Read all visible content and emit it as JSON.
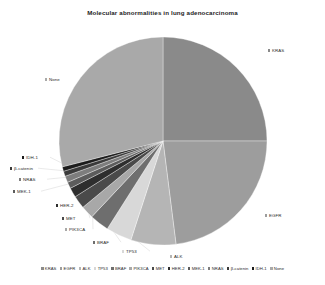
{
  "chart_data": {
    "type": "pie",
    "title": "Molecular abnormalities in lung adenocarcinoma",
    "xlabel": "",
    "ylabel": "",
    "legend_position": "bottom",
    "grid": false,
    "start_angle_deg": 0,
    "direction": "clockwise",
    "categories": [
      "KRAS",
      "EGFR",
      "ALK",
      "TP53",
      "BRAF",
      "PIK3CA",
      "MET",
      "HER-2",
      "MEK-1",
      "NRAS",
      "β-catenin",
      "IDH-1",
      "None"
    ],
    "values": [
      25,
      23,
      7,
      4,
      3,
      2,
      2,
      1.5,
      1,
      1,
      0.8,
      0.7,
      29
    ],
    "colors": [
      "#8a8a8a",
      "#9d9d9d",
      "#b5b5b5",
      "#d8d8d8",
      "#6e6e6e",
      "#a8a8a8",
      "#4a4a4a",
      "#2e2e2e",
      "#5c5c5c",
      "#7d7d7d",
      "#3a3a3a",
      "#1c1c1c",
      "#a9a9a9"
    ],
    "annotations": [
      {
        "label": "KRAS",
        "x": 268,
        "y": 48
      },
      {
        "label": "EGFR",
        "x": 265,
        "y": 213
      },
      {
        "label": "ALK",
        "x": 170,
        "y": 254
      },
      {
        "label": "TP53",
        "x": 122,
        "y": 249
      },
      {
        "label": "BRAF",
        "x": 93,
        "y": 240
      },
      {
        "label": "PIK3CA",
        "x": 65,
        "y": 227
      },
      {
        "label": "MET",
        "x": 62,
        "y": 216
      },
      {
        "label": "HER-2",
        "x": 56,
        "y": 203
      },
      {
        "label": "MEK-1",
        "x": 13,
        "y": 189
      },
      {
        "label": "NRAS",
        "x": 19,
        "y": 177
      },
      {
        "label": "β-catenin",
        "x": 10,
        "y": 166
      },
      {
        "label": "IDH-1",
        "x": 22,
        "y": 155
      },
      {
        "label": "None",
        "x": 45,
        "y": 77
      }
    ]
  },
  "legend": {
    "items": [
      {
        "label": "KRAS",
        "color": "#8a8a8a"
      },
      {
        "label": "EGFR",
        "color": "#9d9d9d"
      },
      {
        "label": "ALK",
        "color": "#b5b5b5"
      },
      {
        "label": "TP53",
        "color": "#d8d8d8"
      },
      {
        "label": "BRAF",
        "color": "#6e6e6e"
      },
      {
        "label": "PIK3CA",
        "color": "#a8a8a8"
      },
      {
        "label": "MET",
        "color": "#4a4a4a"
      },
      {
        "label": "HER-2",
        "color": "#2e2e2e"
      },
      {
        "label": "MEK-1",
        "color": "#5c5c5c"
      },
      {
        "label": "NRAS",
        "color": "#7d7d7d"
      },
      {
        "label": "β-catenin",
        "color": "#3a3a3a"
      },
      {
        "label": "IDH-1",
        "color": "#1c1c1c"
      },
      {
        "label": "None",
        "color": "#a9a9a9"
      }
    ]
  },
  "geometry": {
    "center_x": 163,
    "center_y": 141,
    "radius": 104
  }
}
